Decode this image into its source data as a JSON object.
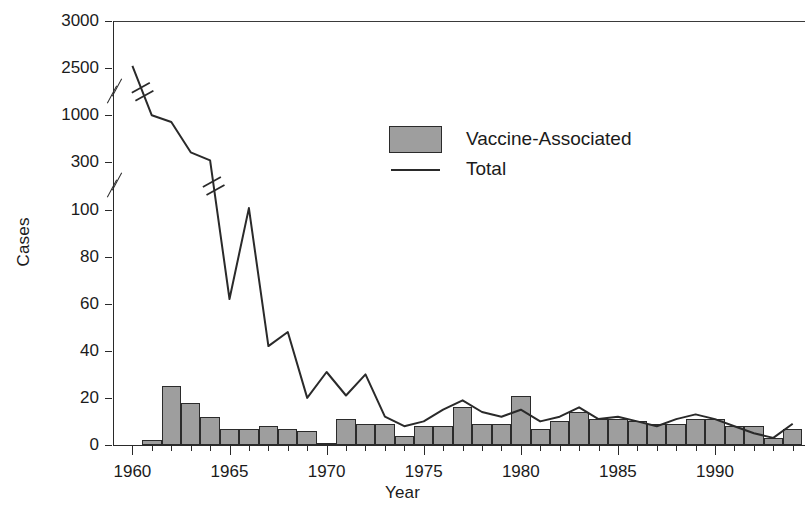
{
  "chart_data": {
    "type": "bar",
    "title": "",
    "xlabel": "Year",
    "ylabel": "Cases",
    "grid": false,
    "legend_position": "upper-center-right",
    "x_axis": {
      "label": "Year",
      "tick_labels": [
        "1960",
        "1965",
        "1970",
        "1975",
        "1980",
        "1985",
        "1990"
      ],
      "tick_values": [
        1960,
        1965,
        1970,
        1975,
        1980,
        1985,
        1990
      ],
      "minor_ticks_every": 1,
      "range": [
        1959,
        1994.5
      ]
    },
    "y_axis": {
      "label": "Cases",
      "tick_labels": [
        "0",
        "20",
        "40",
        "60",
        "80",
        "100",
        "300",
        "1000",
        "2500",
        "3000"
      ],
      "tick_values": [
        0,
        20,
        40,
        60,
        80,
        100,
        300,
        1000,
        2500,
        3000
      ],
      "broken_axis": true,
      "break_segments": [
        "100-300",
        "1000-2500"
      ],
      "range": [
        0,
        3000
      ]
    },
    "categories": [
      1960,
      1961,
      1962,
      1963,
      1964,
      1965,
      1966,
      1967,
      1968,
      1969,
      1970,
      1971,
      1972,
      1973,
      1974,
      1975,
      1976,
      1977,
      1978,
      1979,
      1980,
      1981,
      1982,
      1983,
      1984,
      1985,
      1986,
      1987,
      1988,
      1989,
      1990,
      1991,
      1992,
      1993,
      1994
    ],
    "series": [
      {
        "name": "Vaccine-Associated",
        "type": "bar",
        "values": [
          0,
          2,
          25,
          18,
          12,
          7,
          7,
          8,
          7,
          6,
          1,
          11,
          9,
          9,
          4,
          8,
          8,
          16,
          9,
          9,
          21,
          7,
          10,
          14,
          11,
          11,
          10,
          9,
          9,
          11,
          11,
          8,
          8,
          3,
          7
        ]
      },
      {
        "name": "Total",
        "type": "line",
        "values": [
          2525,
          1000,
          900,
          450,
          330,
          62,
          106,
          42,
          48,
          20,
          31,
          21,
          30,
          12,
          8,
          10,
          15,
          19,
          14,
          12,
          15,
          10,
          12,
          16,
          11,
          12,
          10,
          8,
          11,
          13,
          11,
          8,
          5,
          3,
          9
        ]
      }
    ],
    "annotations": [
      "Axis break between 100 and 300",
      "Axis break between 1000 and 2500",
      "Line series crosses both axis breaks"
    ]
  },
  "legend": {
    "items": [
      {
        "label": "Vaccine-Associated",
        "marker": "filled-box",
        "color": "#9e9e9e"
      },
      {
        "label": "Total",
        "marker": "line",
        "color": "#2a2a2a"
      }
    ]
  },
  "colors": {
    "bar_fill": "#9e9e9e",
    "bar_stroke": "#2b2b2b",
    "line": "#2a2a2a",
    "axis": "#2a2a2a",
    "background": "#ffffff",
    "text": "#1b1b1b"
  }
}
